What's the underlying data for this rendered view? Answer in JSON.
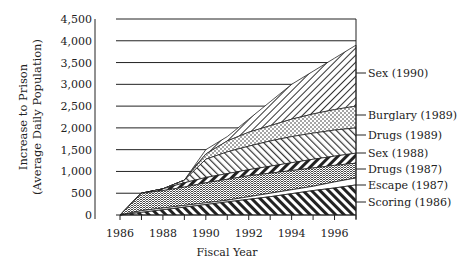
{
  "chart_data": {
    "type": "area",
    "stacked": true,
    "title": "",
    "xlabel": "Fiscal Year",
    "ylabel_line1": "Increase to Prison",
    "ylabel_line2": "(Average Daily Population)",
    "x": [
      1986,
      1987,
      1988,
      1989,
      1990,
      1991,
      1992,
      1993,
      1994,
      1995,
      1996,
      1997
    ],
    "x_ticks": [
      "1986",
      "1988",
      "1990",
      "1992",
      "1994",
      "1996"
    ],
    "y_ticks": [
      "0",
      "500",
      "1,000",
      "1,500",
      "2,000",
      "2,500",
      "3,000",
      "3,500",
      "4,000",
      "4,500"
    ],
    "ylim": [
      0,
      4500
    ],
    "xlim": [
      1986,
      1997
    ],
    "grid": "horizontal",
    "series": [
      {
        "name": "Scoring (1986)",
        "values": [
          0,
          60,
          60,
          60,
          60,
          60,
          60,
          60,
          70,
          70,
          60,
          70
        ],
        "cumulative_top": [
          0,
          60,
          120,
          180,
          240,
          300,
          360,
          420,
          490,
          560,
          620,
          690
        ]
      },
      {
        "name": "Escape (1987)",
        "values": [
          0,
          40,
          40,
          40,
          40,
          40,
          60,
          80,
          90,
          100,
          140,
          160
        ],
        "cumulative_top": [
          0,
          100,
          160,
          220,
          280,
          340,
          420,
          500,
          580,
          660,
          760,
          850
        ]
      },
      {
        "name": "Drugs (1987)",
        "values": [
          0,
          400,
          400,
          420,
          460,
          480,
          480,
          460,
          440,
          420,
          380,
          340
        ],
        "cumulative_top": [
          0,
          500,
          560,
          640,
          740,
          820,
          900,
          960,
          1020,
          1080,
          1140,
          1190
        ]
      },
      {
        "name": "Sex (1988)",
        "values": [
          0,
          0,
          40,
          100,
          120,
          130,
          140,
          160,
          180,
          200,
          210,
          230
        ],
        "cumulative_top": [
          0,
          500,
          600,
          740,
          860,
          950,
          1040,
          1120,
          1200,
          1280,
          1350,
          1420
        ]
      },
      {
        "name": "Drugs (1989)",
        "values": [
          0,
          0,
          0,
          60,
          420,
          500,
          540,
          580,
          600,
          600,
          600,
          580
        ],
        "cumulative_top": [
          0,
          500,
          600,
          800,
          1280,
          1450,
          1580,
          1700,
          1800,
          1880,
          1950,
          2000
        ]
      },
      {
        "name": "Burglary (1989)",
        "values": [
          0,
          0,
          0,
          0,
          120,
          250,
          320,
          350,
          400,
          440,
          470,
          500
        ],
        "cumulative_top": [
          0,
          500,
          600,
          800,
          1400,
          1700,
          1900,
          2050,
          2200,
          2320,
          2420,
          2500
        ]
      },
      {
        "name": "Sex (1990)",
        "values": [
          0,
          0,
          0,
          0,
          100,
          100,
          300,
          550,
          800,
          980,
          1180,
          1400
        ],
        "cumulative_top": [
          0,
          500,
          600,
          800,
          1500,
          1800,
          2200,
          2600,
          3000,
          3300,
          3600,
          3900
        ]
      }
    ],
    "legend_position": "right-inline"
  }
}
